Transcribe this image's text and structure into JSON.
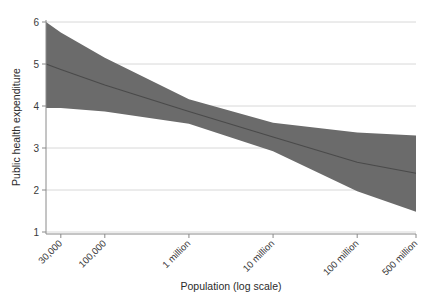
{
  "chart_data": {
    "type": "line",
    "title": "",
    "subtitle": "",
    "xlabel": "Population (log scale)",
    "ylabel": "Public health expenditure",
    "grid": true,
    "legend": false,
    "legend_position": "none",
    "colors": {
      "band_fill": "#6b6b6b",
      "fit_line": "#4a4a4a",
      "gridline": "#d8d8d8",
      "axis_line": "#8a8a8a",
      "tick_label": "#3a3a3a",
      "axis_title": "#2b2b2b",
      "background": "#ffffff"
    },
    "x_axis": {
      "scale": "log",
      "unit": "people",
      "tick_labels": [
        "30,000",
        "100,000",
        "1 million",
        "10 million",
        "100 million",
        "500 million"
      ],
      "tick_values": [
        30000,
        100000,
        1000000,
        10000000,
        100000000,
        500000000
      ],
      "tick_label_rotation_deg": -45,
      "xlim_labels": [
        "~20,000",
        "500 million"
      ],
      "xlim": [
        20000,
        500000000
      ]
    },
    "y_axis": {
      "scale": "linear",
      "tick_labels": [
        "1",
        "2",
        "3",
        "4",
        "5",
        "6"
      ],
      "tick_values": [
        1,
        2,
        3,
        4,
        5,
        6
      ],
      "ylim": [
        1,
        6
      ]
    },
    "series": [
      {
        "name": "Fitted line",
        "type": "line",
        "x": [
          20000,
          30000,
          100000,
          1000000,
          10000000,
          100000000,
          500000000
        ],
        "values": [
          5.0,
          4.87,
          4.5,
          3.87,
          3.26,
          2.66,
          2.4
        ]
      },
      {
        "name": "Confidence interval (upper)",
        "type": "band-upper",
        "x": [
          20000,
          30000,
          100000,
          1000000,
          10000000,
          100000000,
          500000000
        ],
        "values": [
          6.0,
          5.75,
          5.15,
          4.16,
          3.6,
          3.37,
          3.3
        ]
      },
      {
        "name": "Confidence interval (lower)",
        "type": "band-lower",
        "x": [
          20000,
          30000,
          100000,
          1000000,
          10000000,
          100000000,
          500000000
        ],
        "values": [
          3.95,
          3.95,
          3.87,
          3.58,
          2.92,
          1.97,
          1.48
        ]
      }
    ],
    "annotations": []
  }
}
